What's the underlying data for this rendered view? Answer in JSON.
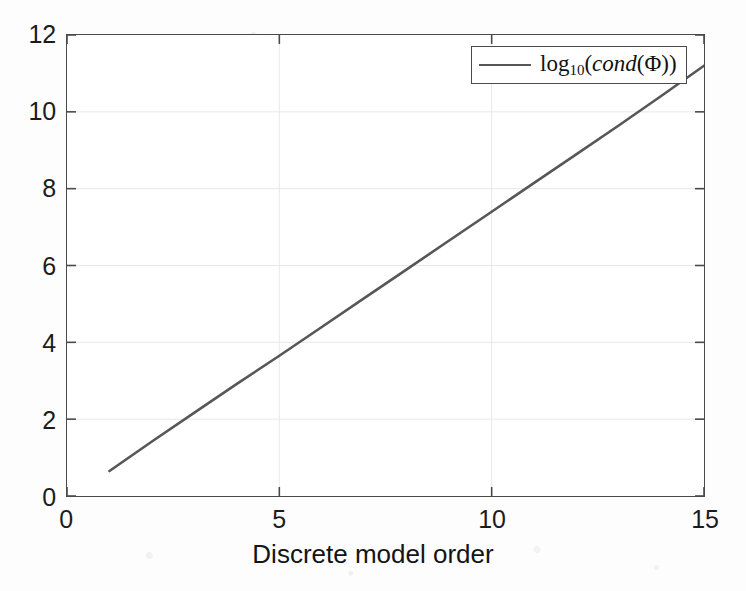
{
  "figure": {
    "background_color": "#fdfdfd",
    "plot_background_color": "#ffffff",
    "axis_color": "#4a4a4a",
    "grid_color": "#e8e8e8",
    "series_color": "#575757"
  },
  "axis_title": {
    "x": "Discrete model order"
  },
  "legend": {
    "entries": [
      {
        "label": "log10(cond(Φ))",
        "log_text": "log",
        "base_text": "10",
        "open_paren": "(",
        "func_text": "cond",
        "inner_open": "(",
        "phi_text": "Φ",
        "close_parens": "))",
        "color": "#575757"
      }
    ],
    "position": "top-right",
    "boxed": true
  },
  "ticks": {
    "x_labels": [
      "0",
      "5",
      "10",
      "15"
    ],
    "y_labels": [
      "0",
      "2",
      "4",
      "6",
      "8",
      "10",
      "12"
    ]
  },
  "chart_data": {
    "type": "line",
    "title": "",
    "subtitle": "",
    "xlabel": "Discrete model order",
    "ylabel": "",
    "xlim": [
      0,
      15
    ],
    "ylim": [
      0,
      12
    ],
    "xticks": [
      0,
      5,
      10,
      15
    ],
    "yticks": [
      0,
      2,
      4,
      6,
      8,
      10,
      12
    ],
    "grid": true,
    "legend_position": "top-right",
    "series": [
      {
        "name": "log10(cond(Φ))",
        "color": "#575757",
        "linewidth": 2.6,
        "x": [
          1,
          2,
          3,
          4,
          5,
          6,
          7,
          8,
          9,
          10,
          11,
          12,
          13,
          14,
          15
        ],
        "y": [
          0.65,
          1.42,
          2.17,
          2.92,
          3.65,
          4.4,
          5.15,
          5.9,
          6.65,
          7.4,
          8.15,
          8.9,
          9.65,
          10.42,
          11.2
        ]
      }
    ]
  }
}
